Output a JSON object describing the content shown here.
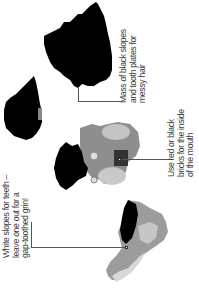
{
  "callouts": [
    {
      "id": "hair",
      "lines": [
        "Mass of black slopes",
        "and tooth plates for",
        "messy hair"
      ]
    },
    {
      "id": "mouth",
      "lines": [
        "Use red or black",
        "bricks for the inside",
        "of the mouth"
      ]
    },
    {
      "id": "teeth",
      "lines": [
        "White slopes for teeth –",
        "leave one out for a",
        "gap-toothed grin!"
      ]
    }
  ],
  "illustrations": [
    {
      "name": "hair-large-piece",
      "color": "#000000"
    },
    {
      "name": "hair-small-piece",
      "color": "#000000"
    },
    {
      "name": "mouth-assembly",
      "color": "#9a9a9a"
    },
    {
      "name": "teeth-jaw-piece",
      "color": "#b8b8b8"
    }
  ]
}
